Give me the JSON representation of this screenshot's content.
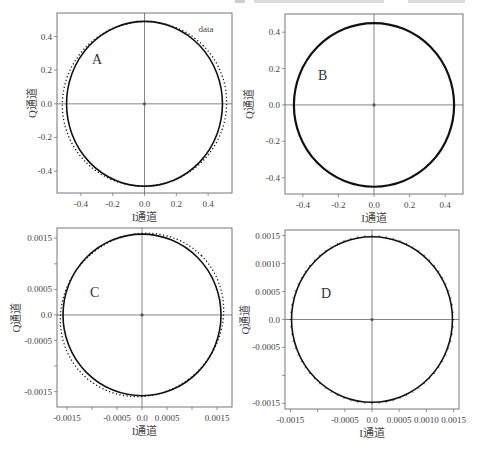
{
  "chart_data": [
    {
      "id": "A",
      "type": "scatter",
      "panel_label": "A",
      "xlabel": "I通道",
      "ylabel": "Q通道",
      "xlim": [
        -0.55,
        0.55
      ],
      "ylim": [
        -0.53,
        0.54
      ],
      "xticks": [
        -0.4,
        -0.2,
        0.0,
        0.2,
        0.4
      ],
      "xtick_labels": [
        "-0.4",
        "-0.2",
        "0.0",
        "0.2",
        "0.4"
      ],
      "yticks": [
        0.4,
        0.2,
        0.0,
        -0.2,
        -0.4
      ],
      "ytick_labels": [
        "0.4",
        "0.2",
        "0.0",
        "-0.2",
        "-0.4"
      ],
      "legend": [
        "data"
      ],
      "series": [
        {
          "name": "fit circle (solid)",
          "shape": "circle",
          "center": [
            0,
            0
          ],
          "radius": 0.49,
          "style": "solid"
        },
        {
          "name": "data",
          "shape": "ellipse",
          "center": [
            0,
            0
          ],
          "semi_major": 0.52,
          "semi_minor": 0.485,
          "rotation_deg": 45,
          "style": "dotted"
        }
      ],
      "crosshair": true
    },
    {
      "id": "B",
      "type": "scatter",
      "panel_label": "B",
      "xlabel": "I通道",
      "ylabel": "Q通道",
      "xlim": [
        -0.5,
        0.5
      ],
      "ylim": [
        -0.49,
        0.5
      ],
      "xticks": [
        -0.4,
        -0.2,
        0.0,
        0.2,
        0.4
      ],
      "xtick_labels": [
        "-0.4",
        "-0.2",
        "0.0",
        "0.2",
        "0.4"
      ],
      "yticks": [
        0.4,
        0.2,
        0.0,
        -0.2,
        -0.4
      ],
      "ytick_labels": [
        "0.4",
        "0.2",
        "0.0",
        "-0.2",
        "-0.4"
      ],
      "series": [
        {
          "name": "corrected circle",
          "shape": "circle",
          "center": [
            0,
            0
          ],
          "radius": 0.45,
          "style": "solid-thick"
        }
      ],
      "crosshair": true
    },
    {
      "id": "C",
      "type": "scatter",
      "panel_label": "C",
      "xlabel": "I通道",
      "ylabel": "Q通道",
      "xlim": [
        -0.0017,
        0.0018
      ],
      "ylim": [
        -0.0018,
        0.0017
      ],
      "xticks": [
        -0.0015,
        -0.001,
        -0.0005,
        0.0,
        0.0005,
        0.001,
        0.0015
      ],
      "xtick_labels": [
        "-0.0015",
        "",
        "-0.0005",
        "0.0",
        "0.0005",
        "",
        "0.0015"
      ],
      "yticks": [
        0.0015,
        0.001,
        0.0005,
        0.0,
        -0.0005,
        -0.001,
        -0.0015
      ],
      "ytick_labels": [
        "0.0015",
        "",
        "0.0005",
        "0.0",
        "-0.0005",
        "",
        "-0.0015"
      ],
      "series": [
        {
          "name": "fit circle (solid)",
          "shape": "circle",
          "center": [
            0,
            0
          ],
          "radius": 0.00158,
          "style": "solid"
        },
        {
          "name": "data",
          "shape": "ellipse",
          "center": [
            0,
            0
          ],
          "semi_major": 0.00168,
          "semi_minor": 0.00155,
          "rotation_deg": 45,
          "style": "dotted"
        }
      ],
      "crosshair": true
    },
    {
      "id": "D",
      "type": "scatter",
      "panel_label": "D",
      "xlabel": "I通道",
      "ylabel": "Q通道",
      "xlim": [
        -0.0016,
        0.0016
      ],
      "ylim": [
        -0.0016,
        0.0016
      ],
      "xticks": [
        -0.0015,
        -0.001,
        -0.0005,
        0.0,
        0.0005,
        0.001,
        0.0015
      ],
      "xtick_labels": [
        "-0.0015",
        "",
        "-0.0005",
        "0.0",
        "0.0005",
        "0.0010",
        "0.0015"
      ],
      "yticks": [
        0.0015,
        0.001,
        0.0005,
        0.0,
        -0.0005,
        -0.001,
        -0.0015
      ],
      "ytick_labels": [
        "0.0015",
        "0.0010",
        "0.0005",
        "0.0",
        "-0.0005",
        "",
        "-0.0015"
      ],
      "series": [
        {
          "name": "corrected circle",
          "shape": "circle",
          "center": [
            0,
            0
          ],
          "radius": 0.00148,
          "style": "solid-with-ticks"
        }
      ],
      "crosshair": true
    }
  ],
  "colors": {
    "frame": "#777777",
    "curve": "#111111",
    "crosshair": "#666666",
    "text": "#444444"
  }
}
